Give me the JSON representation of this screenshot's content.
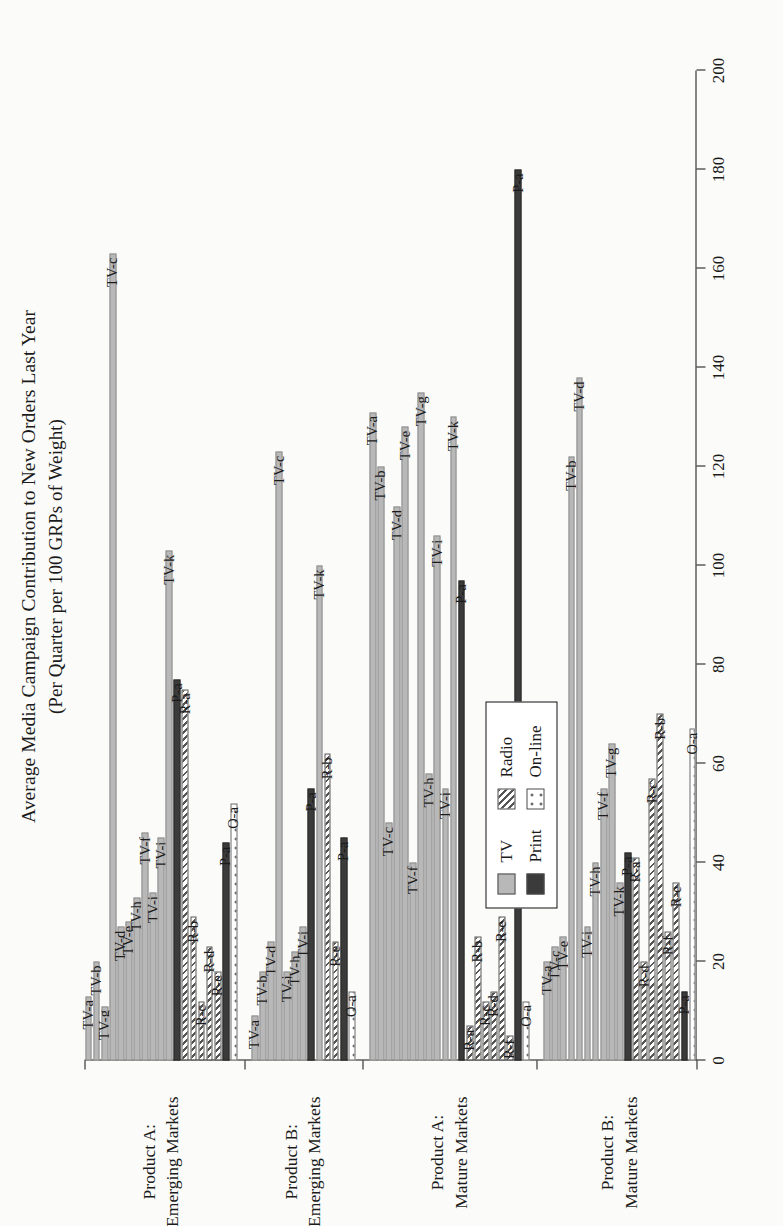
{
  "chart_data": {
    "type": "bar",
    "orientation": "horizontal-grouped",
    "title": "Average Media Campaign Contribution to New Orders Last Year",
    "subtitle": "(Per Quarter per 100 GRPs of Weight)",
    "xlabel": "",
    "ylabel": "",
    "value_axis": {
      "min": 0,
      "max": 200,
      "step": 20,
      "ticks": [
        0,
        20,
        40,
        60,
        80,
        100,
        120,
        140,
        160,
        180,
        200
      ],
      "tick_labels": [
        "0",
        "20",
        "40",
        "60",
        "80",
        "100",
        "120",
        "140",
        "160",
        "180",
        "200"
      ],
      "grid": false
    },
    "legend": {
      "position": "inside-left",
      "entries": [
        {
          "label": "TV",
          "series": "TV",
          "pattern": "solid-light-gray",
          "color": "#b8b8b8"
        },
        {
          "label": "Radio",
          "series": "Radio",
          "pattern": "diagonal-hatch",
          "color": "#555555"
        },
        {
          "label": "Print",
          "series": "Print",
          "pattern": "solid-dark",
          "color": "#3b3b3b"
        },
        {
          "label": "On-line",
          "series": "On-line",
          "pattern": "dotted",
          "color": "#3b3b3b"
        }
      ]
    },
    "groups": [
      {
        "label_line1": "Product A:",
        "label_line2": "Emerging Markets",
        "bars": [
          {
            "label": "TV-a",
            "series": "TV",
            "value": 13
          },
          {
            "label": "TV-b",
            "series": "TV",
            "value": 20
          },
          {
            "label": "TV-g",
            "series": "TV",
            "value": 11
          },
          {
            "label": "TV-c",
            "series": "TV",
            "value": 163
          },
          {
            "label": "TV-d",
            "series": "TV",
            "value": 27
          },
          {
            "label": "TV-e",
            "series": "TV",
            "value": 28
          },
          {
            "label": "TV-h",
            "series": "TV",
            "value": 33
          },
          {
            "label": "TV-f",
            "series": "TV",
            "value": 46
          },
          {
            "label": "TV-j",
            "series": "TV",
            "value": 34
          },
          {
            "label": "TV-i",
            "series": "TV",
            "value": 45
          },
          {
            "label": "TV-k",
            "series": "TV",
            "value": 103
          },
          {
            "label": "P-a",
            "series": "Print",
            "value": 77
          },
          {
            "label": "R-a",
            "series": "Radio",
            "value": 75
          },
          {
            "label": "R-b",
            "series": "Radio",
            "value": 29
          },
          {
            "label": "R-c",
            "series": "Radio",
            "value": 12
          },
          {
            "label": "R-d",
            "series": "Radio",
            "value": 23
          },
          {
            "label": "R-e",
            "series": "Radio",
            "value": 18
          },
          {
            "label": "P-a2",
            "series": "Print",
            "value": 44
          },
          {
            "label": "O-a",
            "series": "On-line",
            "value": 52
          }
        ]
      },
      {
        "label_line1": "Product B:",
        "label_line2": "Emerging Markets",
        "bars": [
          {
            "label": "TV-a",
            "series": "TV",
            "value": 9
          },
          {
            "label": "TV-b",
            "series": "TV",
            "value": 18
          },
          {
            "label": "TV-d",
            "series": "TV",
            "value": 24
          },
          {
            "label": "TV-c",
            "series": "TV",
            "value": 123
          },
          {
            "label": "TV-j",
            "series": "TV",
            "value": 18
          },
          {
            "label": "TV-h",
            "series": "TV",
            "value": 22
          },
          {
            "label": "TV-i",
            "series": "TV",
            "value": 27
          },
          {
            "label": "P-a",
            "series": "Print",
            "value": 55
          },
          {
            "label": "TV-k",
            "series": "TV",
            "value": 100
          },
          {
            "label": "R-b",
            "series": "Radio",
            "value": 62
          },
          {
            "label": "R-e",
            "series": "Radio",
            "value": 24
          },
          {
            "label": "P-a2",
            "series": "Print",
            "value": 45
          },
          {
            "label": "O-a",
            "series": "On-line",
            "value": 14
          }
        ]
      },
      {
        "label_line1": "Product A:",
        "label_line2": "Mature Markets",
        "bars": [
          {
            "label": "TV-a",
            "series": "TV",
            "value": 131
          },
          {
            "label": "TV-b",
            "series": "TV",
            "value": 120
          },
          {
            "label": "TV-c",
            "series": "TV",
            "value": 48
          },
          {
            "label": "TV-d",
            "series": "TV",
            "value": 112
          },
          {
            "label": "TV-e",
            "series": "TV",
            "value": 128
          },
          {
            "label": "TV-f",
            "series": "TV",
            "value": 40
          },
          {
            "label": "TV-g",
            "series": "TV",
            "value": 135
          },
          {
            "label": "TV-h",
            "series": "TV",
            "value": 58
          },
          {
            "label": "TV-i",
            "series": "TV",
            "value": 106
          },
          {
            "label": "TV-j",
            "series": "TV",
            "value": 55
          },
          {
            "label": "TV-k",
            "series": "TV",
            "value": 130
          },
          {
            "label": "P-a",
            "series": "Print",
            "value": 97
          },
          {
            "label": "R-a",
            "series": "Radio",
            "value": 7
          },
          {
            "label": "R-b",
            "series": "Radio",
            "value": 25
          },
          {
            "label": "R-c",
            "series": "Radio",
            "value": 12
          },
          {
            "label": "R-d",
            "series": "Radio",
            "value": 14
          },
          {
            "label": "R-e",
            "series": "Radio",
            "value": 29
          },
          {
            "label": "R-f",
            "series": "Radio",
            "value": 5
          },
          {
            "label": "P-a2",
            "series": "Print",
            "value": 180
          },
          {
            "label": "O-a",
            "series": "On-line",
            "value": 12
          }
        ]
      },
      {
        "label_line1": "Product B:",
        "label_line2": "Mature Markets",
        "bars": [
          {
            "label": "TV-a",
            "series": "TV",
            "value": 20
          },
          {
            "label": "TV-c",
            "series": "TV",
            "value": 23
          },
          {
            "label": "TV-e",
            "series": "TV",
            "value": 25
          },
          {
            "label": "TV-b",
            "series": "TV",
            "value": 122
          },
          {
            "label": "TV-d",
            "series": "TV",
            "value": 138
          },
          {
            "label": "TV-i",
            "series": "TV",
            "value": 27
          },
          {
            "label": "TV-h",
            "series": "TV",
            "value": 40
          },
          {
            "label": "TV-f",
            "series": "TV",
            "value": 55
          },
          {
            "label": "TV-g",
            "series": "TV",
            "value": 64
          },
          {
            "label": "TV-k",
            "series": "TV",
            "value": 36
          },
          {
            "label": "P-a",
            "series": "Print",
            "value": 42
          },
          {
            "label": "R-a",
            "series": "Radio",
            "value": 41
          },
          {
            "label": "R-d",
            "series": "Radio",
            "value": 20
          },
          {
            "label": "R-c",
            "series": "Radio",
            "value": 57
          },
          {
            "label": "R-b",
            "series": "Radio",
            "value": 70
          },
          {
            "label": "R-f",
            "series": "Radio",
            "value": 26
          },
          {
            "label": "R-e",
            "series": "Radio",
            "value": 36
          },
          {
            "label": "P-a2",
            "series": "Print",
            "value": 14
          },
          {
            "label": "O-a",
            "series": "On-line",
            "value": 67
          }
        ]
      }
    ]
  }
}
